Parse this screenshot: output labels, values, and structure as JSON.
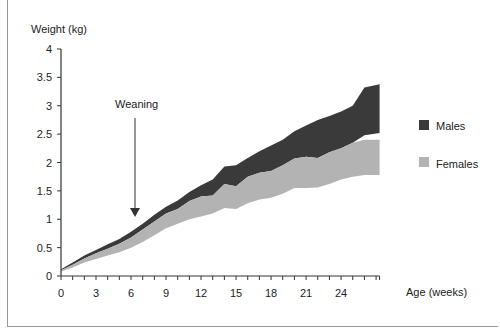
{
  "chart_data": {
    "type": "area",
    "title": "",
    "xlabel": "Age (weeks)",
    "ylabel": "Weight (kg)",
    "xlim": [
      0,
      27.3
    ],
    "ylim": [
      0,
      4
    ],
    "xticks": [
      0,
      3,
      6,
      9,
      12,
      15,
      18,
      21,
      24
    ],
    "yticks": [
      0,
      0.5,
      1,
      1.5,
      2,
      2.5,
      3,
      3.5,
      4
    ],
    "ytick_labels": [
      "0",
      "0.5",
      "1",
      "1.5",
      "2",
      "2.5",
      "3",
      "3.5",
      "4"
    ],
    "grid": false,
    "legend_position": "right",
    "annotation": {
      "text": "Weaning",
      "x": 6.3,
      "arrow_from_y": 3.0,
      "arrow_to_y": 1.05
    },
    "x": [
      0,
      1,
      2,
      3,
      4,
      5,
      6,
      7,
      8,
      9,
      10,
      11,
      12,
      13,
      14,
      15,
      16,
      17,
      18,
      19,
      20,
      21,
      22,
      23,
      24,
      25,
      26,
      27.3
    ],
    "series": [
      {
        "name": "Males",
        "color": "#3a3a3a",
        "upper": [
          0.12,
          0.24,
          0.36,
          0.46,
          0.56,
          0.65,
          0.78,
          0.92,
          1.08,
          1.22,
          1.33,
          1.48,
          1.6,
          1.7,
          1.93,
          1.95,
          2.08,
          2.2,
          2.3,
          2.4,
          2.55,
          2.65,
          2.75,
          2.82,
          2.9,
          3.0,
          3.32,
          3.38
        ],
        "lower": [
          0.1,
          0.2,
          0.31,
          0.4,
          0.48,
          0.57,
          0.68,
          0.82,
          0.96,
          1.1,
          1.18,
          1.32,
          1.4,
          1.42,
          1.62,
          1.58,
          1.75,
          1.82,
          1.85,
          1.95,
          2.07,
          2.1,
          2.08,
          2.18,
          2.25,
          2.35,
          2.48,
          2.52
        ]
      },
      {
        "name": "Females",
        "color": "#b3b3b3",
        "upper": [
          0.1,
          0.2,
          0.31,
          0.4,
          0.48,
          0.57,
          0.68,
          0.82,
          0.96,
          1.1,
          1.18,
          1.32,
          1.4,
          1.42,
          1.62,
          1.58,
          1.75,
          1.82,
          1.85,
          1.95,
          2.07,
          2.1,
          2.08,
          2.18,
          2.25,
          2.35,
          2.4,
          2.4
        ],
        "lower": [
          0.08,
          0.15,
          0.24,
          0.3,
          0.36,
          0.42,
          0.5,
          0.6,
          0.72,
          0.84,
          0.92,
          1.0,
          1.05,
          1.1,
          1.2,
          1.18,
          1.28,
          1.35,
          1.38,
          1.45,
          1.55,
          1.55,
          1.56,
          1.62,
          1.7,
          1.75,
          1.78,
          1.78
        ]
      }
    ]
  }
}
